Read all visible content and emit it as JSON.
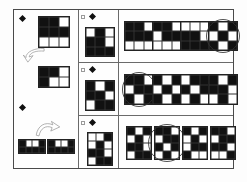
{
  "page": {
    "type": "non-verbal-reasoning-worksheet",
    "title": "",
    "background_color": "#ffffff",
    "frame_color": "#4a4a4a",
    "fill_color": "#111111",
    "empty_color": "#ffffff"
  },
  "examples": {
    "marker": "diamond",
    "items": [
      {
        "name": "example-one",
        "source": {
          "rows": 3,
          "cols": 3,
          "cells": [
            [
              1,
              1,
              0
            ],
            [
              1,
              1,
              1
            ],
            [
              0,
              0,
              0
            ]
          ]
        },
        "arrow": "curved-arrow-down-left",
        "result": {
          "rows": 2,
          "cols": 3,
          "cells": [
            [
              1,
              1,
              0
            ],
            [
              1,
              0,
              0
            ]
          ]
        }
      },
      {
        "name": "example-two",
        "source": {
          "rows": 2,
          "cols": 4,
          "cells": [
            [
              1,
              0,
              0,
              1
            ],
            [
              1,
              1,
              1,
              1
            ]
          ]
        },
        "arrow": "curved-arrow-right",
        "result": {
          "rows": 2,
          "cols": 4,
          "cells": [
            [
              1,
              0,
              0,
              1
            ],
            [
              1,
              1,
              1,
              1
            ]
          ]
        }
      }
    ]
  },
  "questions": [
    {
      "number": "1",
      "marker": "diamond",
      "prompt": {
        "rows": 3,
        "cols": 3,
        "cells": [
          [
            0,
            1,
            0
          ],
          [
            1,
            1,
            0
          ],
          [
            1,
            1,
            1
          ]
        ]
      },
      "selected_option": 4,
      "options": [
        {
          "label": "A",
          "rows": 3,
          "cols": 3,
          "cells": [
            [
              1,
              1,
              0
            ],
            [
              1,
              1,
              1
            ],
            [
              0,
              0,
              0
            ]
          ]
        },
        {
          "label": "B",
          "rows": 3,
          "cols": 3,
          "cells": [
            [
              1,
              1,
              0
            ],
            [
              0,
              1,
              1
            ],
            [
              0,
              0,
              0
            ]
          ]
        },
        {
          "label": "C",
          "rows": 3,
          "cols": 3,
          "cells": [
            [
              0,
              0,
              0
            ],
            [
              1,
              1,
              0
            ],
            [
              1,
              1,
              1
            ]
          ]
        },
        {
          "label": "D",
          "rows": 3,
          "cols": 3,
          "cells": [
            [
              1,
              0,
              1
            ],
            [
              0,
              1,
              0
            ],
            [
              1,
              0,
              1
            ]
          ]
        }
      ]
    },
    {
      "number": "2",
      "marker": "diamond",
      "prompt": {
        "rows": 3,
        "cols": 3,
        "cells": [
          [
            1,
            0,
            1
          ],
          [
            1,
            1,
            0
          ],
          [
            0,
            1,
            1
          ]
        ]
      },
      "selected_option": 1,
      "options": [
        {
          "label": "A",
          "rows": 3,
          "cols": 3,
          "cells": [
            [
              1,
              1,
              0
            ],
            [
              0,
              1,
              1
            ],
            [
              1,
              0,
              1
            ]
          ]
        },
        {
          "label": "B",
          "rows": 3,
          "cols": 3,
          "cells": [
            [
              1,
              0,
              1
            ],
            [
              0,
              1,
              0
            ],
            [
              1,
              0,
              1
            ]
          ]
        },
        {
          "label": "C",
          "rows": 3,
          "cols": 3,
          "cells": [
            [
              0,
              1,
              1
            ],
            [
              1,
              0,
              1
            ],
            [
              0,
              1,
              0
            ]
          ]
        },
        {
          "label": "D",
          "rows": 3,
          "cols": 3,
          "cells": [
            [
              1,
              0,
              1
            ],
            [
              1,
              1,
              0
            ],
            [
              0,
              1,
              0
            ]
          ]
        }
      ]
    },
    {
      "number": "3",
      "marker": "diamond",
      "prompt": {
        "rows": 4,
        "cols": 3,
        "cells": [
          [
            0,
            0,
            1
          ],
          [
            0,
            1,
            0
          ],
          [
            1,
            1,
            0
          ],
          [
            0,
            1,
            1
          ]
        ]
      },
      "selected_option": 2,
      "options": [
        {
          "label": "A",
          "rows": 4,
          "cols": 3,
          "cells": [
            [
              1,
              0,
              1
            ],
            [
              0,
              1,
              0
            ],
            [
              1,
              1,
              0
            ],
            [
              0,
              1,
              1
            ]
          ]
        },
        {
          "label": "B",
          "rows": 4,
          "cols": 3,
          "cells": [
            [
              1,
              1,
              0
            ],
            [
              0,
              1,
              1
            ],
            [
              1,
              0,
              1
            ],
            [
              0,
              1,
              0
            ]
          ]
        },
        {
          "label": "C",
          "rows": 4,
          "cols": 3,
          "cells": [
            [
              1,
              0,
              1
            ],
            [
              0,
              1,
              0
            ],
            [
              0,
              1,
              1
            ],
            [
              1,
              0,
              0
            ]
          ]
        },
        {
          "label": "D",
          "rows": 4,
          "cols": 3,
          "cells": [
            [
              1,
              1,
              0
            ],
            [
              0,
              1,
              1
            ],
            [
              1,
              1,
              0
            ],
            [
              0,
              0,
              1
            ]
          ]
        }
      ]
    }
  ]
}
